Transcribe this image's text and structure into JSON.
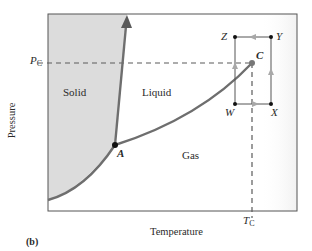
{
  "figure": {
    "panel_label": "(b)",
    "x_axis_title": "Temperature",
    "y_axis_title": "Pressure",
    "critical_pressure_label": {
      "main": "P",
      "sub": "C"
    },
    "critical_temperature_label": {
      "main": "T",
      "sub": "C"
    },
    "regions": {
      "solid": "Solid",
      "liquid": "Liquid",
      "gas": "Gas"
    },
    "points": {
      "triple": "A",
      "critical": "C",
      "w": "W",
      "x": "X",
      "y": "Y",
      "z": "Z"
    },
    "colors": {
      "solid_fill": "#dcdcdc",
      "curve": "#6e6e6e",
      "frame": "#555555",
      "path": "#555555",
      "arrow": "#a8a8a8",
      "dashes": "#5a5a5a"
    }
  }
}
